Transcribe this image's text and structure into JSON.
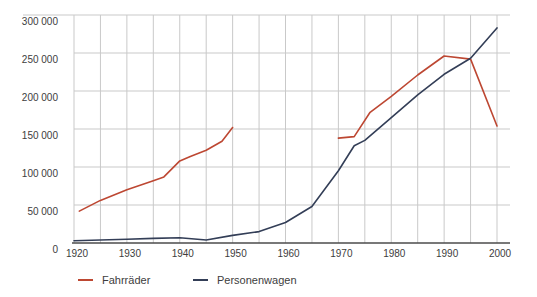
{
  "chart_data": {
    "type": "line",
    "title": "",
    "x_axis": {
      "min": 1920,
      "max": 2000,
      "gridline_interval_years": 5,
      "tick_years": [
        1920,
        1930,
        1940,
        1950,
        1960,
        1970,
        1980,
        1990,
        2000
      ]
    },
    "y_axis": {
      "min": 0,
      "max": 300000,
      "tick_interval": 50000,
      "tick_labels": [
        "0",
        "50 000",
        "100 000",
        "150 000",
        "200 000",
        "250 000",
        "300 000"
      ]
    },
    "grid": true,
    "legend_position": "bottom-left",
    "series": [
      {
        "name": "Fahrräder",
        "color": "#bd4732",
        "segments": [
          [
            [
              1921,
              42000
            ],
            [
              1925,
              56000
            ],
            [
              1930,
              70000
            ],
            [
              1935,
              82000
            ],
            [
              1937,
              87000
            ],
            [
              1940,
              108000
            ],
            [
              1942,
              114000
            ],
            [
              1945,
              122000
            ],
            [
              1948,
              134000
            ],
            [
              1950,
              152000
            ]
          ],
          [
            [
              1970,
              138000
            ],
            [
              1973,
              140000
            ],
            [
              1976,
              172000
            ],
            [
              1980,
              193000
            ],
            [
              1985,
              221000
            ],
            [
              1990,
              246000
            ],
            [
              1995,
              242000
            ],
            [
              2000,
              154000
            ]
          ]
        ]
      },
      {
        "name": "Personenwagen",
        "color": "#333e57",
        "segments": [
          [
            [
              1920,
              3000
            ],
            [
              1925,
              4000
            ],
            [
              1930,
              5000
            ],
            [
              1935,
              6000
            ],
            [
              1940,
              7000
            ],
            [
              1945,
              4000
            ],
            [
              1950,
              10000
            ],
            [
              1955,
              15000
            ],
            [
              1960,
              27000
            ],
            [
              1965,
              48000
            ],
            [
              1970,
              95000
            ],
            [
              1973,
              128000
            ],
            [
              1975,
              135000
            ],
            [
              1980,
              165000
            ],
            [
              1985,
              195000
            ],
            [
              1990,
              222000
            ],
            [
              1995,
              243000
            ],
            [
              2000,
              283000
            ]
          ]
        ]
      }
    ]
  },
  "legend": {
    "items": [
      {
        "label": "Fahrräder",
        "color": "#bd4732"
      },
      {
        "label": "Personenwagen",
        "color": "#333e57"
      }
    ]
  },
  "colors": {
    "background": "#ffffff",
    "gridline": "#c9c9c9",
    "axis": "#4b4b4b",
    "tick_text": "#3d3d3d"
  }
}
